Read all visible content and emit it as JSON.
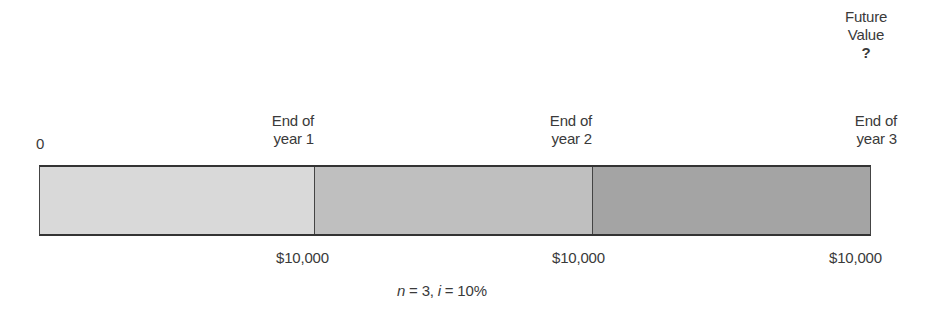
{
  "diagram": {
    "top_label": {
      "line1": "Future",
      "line2": "Value",
      "line3": "?"
    },
    "timeline_points": [
      {
        "label": "0"
      },
      {
        "line1": "End of",
        "line2": "year 1"
      },
      {
        "line1": "End of",
        "line2": "year 2"
      },
      {
        "line1": "End of",
        "line2": "year 3"
      }
    ],
    "segments": [
      {
        "name": "year-1",
        "color": "#d9d9d9"
      },
      {
        "name": "year-2",
        "color": "#bfbfbf"
      },
      {
        "name": "year-3",
        "color": "#a4a4a4"
      }
    ],
    "payments": [
      "$10,000",
      "$10,000",
      "$10,000"
    ],
    "params": {
      "n_var": "n",
      "n_eq": " = 3, ",
      "i_var": "i",
      "i_eq": " = 10%"
    }
  }
}
